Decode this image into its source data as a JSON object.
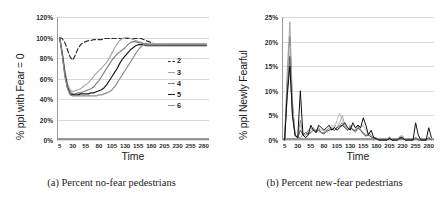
{
  "figure": {
    "panels": [
      {
        "id": "a",
        "caption": "(a) Percent no-fear pedestrians",
        "xtitle": "Time",
        "ytitle": "% ppl with Fear = 0"
      },
      {
        "id": "b",
        "caption": "(b) Percent new-fear pedestrians",
        "xtitle": "Time",
        "ytitle": "% ppl Newly Fearful"
      }
    ]
  },
  "chart_data": [
    {
      "type": "line",
      "title": "(a) Percent no-fear pedestrians",
      "xlabel": "Time",
      "ylabel": "% ppl with Fear = 0",
      "xlim": [
        0,
        290
      ],
      "ylim": [
        0,
        120
      ],
      "yticks": [
        "0%",
        "20%",
        "40%",
        "60%",
        "80%",
        "100%",
        "120%"
      ],
      "ytick_values": [
        0,
        20,
        40,
        60,
        80,
        100,
        120
      ],
      "xticks": [
        "5",
        "30",
        "55",
        "80",
        "105",
        "130",
        "155",
        "180",
        "205",
        "230",
        "255",
        "280"
      ],
      "xtick_values": [
        5,
        30,
        55,
        80,
        105,
        130,
        155,
        180,
        205,
        230,
        255,
        280
      ],
      "grid": true,
      "legend_position": "right-inside",
      "legend": [
        "2",
        "3",
        "4",
        "5",
        "6"
      ],
      "x": [
        5,
        10,
        15,
        20,
        25,
        30,
        35,
        40,
        45,
        50,
        55,
        60,
        65,
        70,
        75,
        80,
        85,
        90,
        95,
        100,
        105,
        110,
        115,
        120,
        125,
        130,
        135,
        140,
        145,
        150,
        155,
        160,
        165,
        170,
        175,
        180,
        185,
        190,
        195,
        200,
        205,
        210,
        215,
        220,
        225,
        230,
        235,
        240,
        245,
        250,
        255,
        260,
        265,
        270,
        275,
        280,
        285
      ],
      "series": [
        {
          "name": "2",
          "style": "dashed",
          "color": "#2b2b2b",
          "values": [
            100,
            99,
            95,
            88,
            81,
            78,
            83,
            89,
            93,
            95,
            96,
            97,
            97,
            98,
            98,
            98,
            98,
            99,
            99,
            99,
            99,
            99,
            99,
            99,
            99,
            99,
            99,
            99,
            99,
            99,
            99,
            99,
            98,
            97,
            96,
            95,
            94,
            94,
            94,
            93,
            93,
            93,
            93,
            93,
            93,
            93,
            93,
            93,
            93,
            93,
            93,
            93,
            93,
            93,
            93,
            93,
            93
          ]
        },
        {
          "name": "3",
          "style": "solid",
          "color": "#a6a6a6",
          "values": [
            100,
            86,
            68,
            55,
            49,
            47,
            48,
            49,
            50,
            52,
            54,
            56,
            59,
            62,
            65,
            68,
            70,
            73,
            76,
            80,
            85,
            90,
            94,
            97,
            99,
            100,
            100,
            99,
            98,
            97,
            96,
            95,
            94,
            94,
            94,
            94,
            94,
            94,
            94,
            94,
            94,
            94,
            94,
            94,
            94,
            94,
            94,
            94,
            94,
            94,
            94,
            94,
            94,
            94,
            94,
            94,
            94
          ]
        },
        {
          "name": "4",
          "style": "solid",
          "color": "#7f7f7f",
          "values": [
            100,
            85,
            66,
            53,
            47,
            45,
            45,
            46,
            46,
            47,
            48,
            49,
            50,
            52,
            55,
            58,
            62,
            66,
            70,
            74,
            78,
            81,
            84,
            86,
            88,
            90,
            93,
            95,
            96,
            96,
            95,
            95,
            94,
            94,
            93,
            93,
            93,
            93,
            93,
            93,
            93,
            93,
            93,
            93,
            93,
            93,
            93,
            93,
            93,
            93,
            93,
            93,
            93,
            93,
            93,
            93,
            93
          ]
        },
        {
          "name": "5",
          "style": "solid",
          "color": "#1a1a1a",
          "values": [
            100,
            84,
            64,
            51,
            45,
            44,
            44,
            44,
            45,
            45,
            45,
            45,
            46,
            46,
            47,
            48,
            49,
            51,
            54,
            58,
            62,
            66,
            70,
            75,
            79,
            82,
            85,
            88,
            90,
            92,
            93,
            93,
            93,
            92,
            92,
            92,
            92,
            92,
            92,
            92,
            92,
            92,
            92,
            92,
            92,
            92,
            92,
            92,
            92,
            92,
            92,
            92,
            92,
            92,
            92,
            92,
            92
          ]
        },
        {
          "name": "6",
          "style": "solid",
          "color": "#8c8c8c",
          "values": [
            100,
            83,
            62,
            50,
            44,
            43,
            43,
            43,
            43,
            43,
            43,
            43,
            43,
            43,
            43,
            44,
            44,
            45,
            46,
            47,
            49,
            52,
            56,
            60,
            64,
            68,
            72,
            76,
            80,
            84,
            88,
            91,
            93,
            93,
            93,
            93,
            93,
            93,
            93,
            93,
            93,
            93,
            93,
            93,
            93,
            93,
            93,
            93,
            93,
            93,
            93,
            93,
            93,
            93,
            93,
            93,
            93
          ]
        }
      ]
    },
    {
      "type": "line",
      "title": "(b) Percent new-fear pedestrians",
      "xlabel": "Time",
      "ylabel": "% ppl Newly Fearful",
      "xlim": [
        0,
        290
      ],
      "ylim": [
        0,
        25
      ],
      "yticks": [
        "0%",
        "5%",
        "10%",
        "15%",
        "20%",
        "25%"
      ],
      "ytick_values": [
        0,
        5,
        10,
        15,
        20,
        25
      ],
      "xticks": [
        "5",
        "30",
        "55",
        "80",
        "105",
        "130",
        "155",
        "180",
        "205",
        "230",
        "255",
        "280"
      ],
      "xtick_values": [
        5,
        30,
        55,
        80,
        105,
        130,
        155,
        180,
        205,
        230,
        255,
        280
      ],
      "grid": true,
      "legend_position": "right-inside",
      "legend": [
        "2",
        "3",
        "4",
        "5",
        "6"
      ],
      "x": [
        5,
        10,
        15,
        20,
        25,
        30,
        35,
        40,
        45,
        50,
        55,
        60,
        65,
        70,
        75,
        80,
        85,
        90,
        95,
        100,
        105,
        110,
        115,
        120,
        125,
        130,
        135,
        140,
        145,
        150,
        155,
        160,
        165,
        170,
        175,
        180,
        185,
        190,
        195,
        200,
        205,
        210,
        215,
        220,
        225,
        230,
        235,
        240,
        245,
        250,
        255,
        260,
        265,
        270,
        275,
        280,
        285
      ],
      "series": [
        {
          "name": "2",
          "style": "solid",
          "color": "#a6a6a6",
          "values": [
            0,
            14,
            24,
            8,
            1,
            0.5,
            0.5,
            1,
            1.5,
            1,
            2,
            2.5,
            1.5,
            2,
            1.5,
            1.5,
            2,
            2.5,
            2,
            3,
            2.5,
            3.5,
            5,
            3,
            2,
            2.5,
            2,
            1.5,
            2.5,
            2,
            1.5,
            1,
            1.5,
            1,
            0.5,
            0.5,
            0,
            0,
            0,
            0,
            0.7,
            0,
            0,
            0,
            0.7,
            0.8,
            0,
            0,
            0,
            0,
            0.6,
            0,
            0,
            0,
            0,
            0.6,
            0
          ]
        },
        {
          "name": "3",
          "style": "solid",
          "color": "#8c8c8c",
          "values": [
            0,
            12,
            21,
            7,
            1,
            0.5,
            4,
            1,
            1,
            2,
            2.5,
            2,
            2,
            2.5,
            1.5,
            1.5,
            2,
            2,
            2.5,
            2,
            2.5,
            3,
            3.5,
            2.5,
            2,
            3,
            2,
            2,
            3,
            2,
            1.5,
            1,
            1,
            0.7,
            0.5,
            0.3,
            0,
            0,
            0,
            0,
            0.5,
            0,
            0,
            0,
            0.5,
            0.6,
            0,
            0,
            0,
            0,
            0.5,
            0,
            0,
            0,
            0,
            0.5,
            0
          ]
        },
        {
          "name": "4",
          "style": "solid",
          "color": "#bfbfbf",
          "values": [
            0,
            11,
            19,
            6,
            1,
            0.5,
            3,
            1.5,
            1,
            1.5,
            2,
            2.5,
            2,
            1.5,
            2,
            2,
            1.5,
            2,
            3,
            2.5,
            4,
            5.5,
            4,
            3,
            2.5,
            2,
            3,
            2.5,
            2,
            2.5,
            3,
            2,
            1,
            0.8,
            0.5,
            0.2,
            0,
            0,
            0,
            0,
            0.5,
            0,
            0,
            0,
            0.8,
            0.9,
            0,
            0,
            0,
            0,
            0.4,
            0,
            0,
            0,
            0,
            0.4,
            0
          ]
        },
        {
          "name": "5",
          "style": "solid",
          "color": "#595959",
          "values": [
            0,
            10,
            17,
            5,
            0.8,
            0.4,
            2,
            1,
            1.5,
            1.2,
            1.5,
            2,
            1.8,
            2,
            1.5,
            1.2,
            1.8,
            2,
            2.2,
            2,
            2.5,
            2.8,
            3,
            2.5,
            2,
            2.5,
            2.2,
            1.8,
            2.5,
            2,
            1.2,
            0.8,
            1,
            0.6,
            0.4,
            0.2,
            0,
            0,
            0,
            0,
            0.4,
            0,
            0,
            0,
            0.5,
            0.5,
            0,
            0,
            0,
            0,
            0.4,
            0,
            0,
            0,
            0,
            0.4,
            0
          ]
        },
        {
          "name": "6",
          "style": "solid",
          "color": "#111111",
          "values": [
            0,
            9,
            15,
            5,
            1,
            0.5,
            10,
            1,
            0.5,
            1,
            3,
            2,
            1.5,
            3,
            2.5,
            2,
            2.5,
            3,
            2,
            2.5,
            2,
            2.5,
            3,
            3.5,
            2.5,
            2,
            3.5,
            2.5,
            3,
            2.5,
            4.5,
            3,
            1,
            2,
            0.5,
            0.3,
            0,
            0,
            0,
            0,
            0.3,
            0,
            0,
            0,
            0.4,
            0.4,
            0,
            0,
            0,
            0,
            3.5,
            1,
            0,
            0,
            0,
            2.5,
            0.5
          ]
        }
      ]
    }
  ],
  "legend_a": [
    {
      "label": "2",
      "style": "dashed",
      "color": "#2b2b2b"
    },
    {
      "label": "3",
      "style": "solid",
      "color": "#a6a6a6"
    },
    {
      "label": "4",
      "style": "solid",
      "color": "#7f7f7f"
    },
    {
      "label": "5",
      "style": "solid",
      "color": "#1a1a1a"
    },
    {
      "label": "6",
      "style": "solid",
      "color": "#8c8c8c"
    }
  ],
  "legend_b_rows": [
    [
      {
        "label": "2",
        "color": "#a6a6a6"
      },
      {
        "label": "3",
        "color": "#8c8c8c"
      },
      {
        "label": "4",
        "color": "#bfbfbf"
      }
    ],
    [
      {
        "label": "5",
        "color": "#595959"
      },
      {
        "label": "6",
        "color": "#111111"
      }
    ]
  ]
}
